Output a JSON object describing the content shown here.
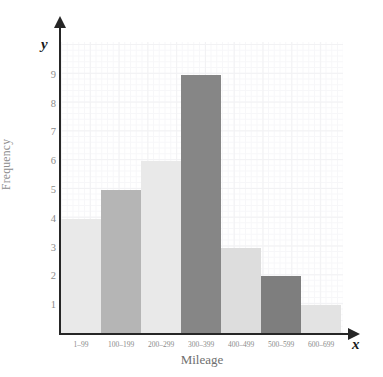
{
  "chart_data": {
    "type": "bar",
    "title": "",
    "subtitle": "",
    "xlabel": "Mileage",
    "ylabel": "Frequency",
    "x_axis_letter": "x",
    "y_axis_letter": "y",
    "categories": [
      "1–99",
      "100–199",
      "200–299",
      "300–399",
      "400–499",
      "500–599",
      "600–699"
    ],
    "values": [
      4,
      5,
      6,
      9,
      3,
      2,
      1
    ],
    "bar_colors": [
      "#e9e9e9",
      "#b5b5b5",
      "#e9e9e9",
      "#868686",
      "#dddddd",
      "#7e7e7e",
      "#e3e3e3"
    ],
    "ylim": [
      0,
      10
    ],
    "yticks": [
      1,
      2,
      3,
      4,
      5,
      6,
      7,
      8,
      9
    ],
    "ytick_labels": [
      "1",
      "2",
      "3",
      "4",
      "5",
      "6",
      "7",
      "8",
      "9"
    ],
    "grid": true,
    "grid_color": "#f2f2f4",
    "legend": null,
    "legend_position": "none",
    "axis_color": "#262626",
    "tick_label_color": "#8c8c8c",
    "axis_title_color": "#6f6f6f"
  }
}
